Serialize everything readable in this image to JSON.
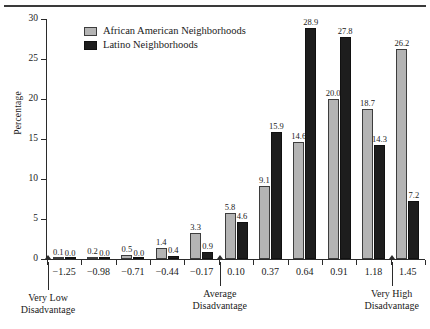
{
  "chart_data": {
    "type": "bar",
    "title": "",
    "xlabel": "",
    "ylabel": "Percentage",
    "ylim": [
      0,
      30
    ],
    "yticks": [
      0,
      5,
      10,
      15,
      20,
      25,
      30
    ],
    "grid": false,
    "legend_position": "top-left-inside",
    "categories": [
      "-1.25",
      "-0.98",
      "-0.71",
      "-0.44",
      "-0.17",
      "0.10",
      "0.37",
      "0.64",
      "0.91",
      "1.18",
      "1.45"
    ],
    "series": [
      {
        "name": "African American Neighborhoods",
        "color": "#b4b4b4",
        "values": [
          0.1,
          0.2,
          0.5,
          1.4,
          3.3,
          5.8,
          9.1,
          14.6,
          20.0,
          18.7,
          26.2
        ],
        "labels": [
          "0.1",
          "0.2",
          "0.5",
          "1.4",
          "3.3",
          "5.8",
          "9.1",
          "14.6",
          "20.0",
          "18.7",
          "26.2"
        ]
      },
      {
        "name": "Latino Neighborhoods",
        "color": "#1d1d1d",
        "values": [
          0.0,
          0.0,
          0.0,
          0.4,
          0.9,
          4.6,
          15.9,
          28.9,
          27.8,
          14.3,
          7.2
        ],
        "labels": [
          "0.0",
          "0.0",
          "0.0",
          "0.4",
          "0.9",
          "4.6",
          "15.9",
          "28.9",
          "27.8",
          "14.3",
          "7.2"
        ]
      }
    ],
    "annotations": [
      {
        "text_line1": "Very Low",
        "text_line2": "Disadvantage",
        "at_category": "-1.25"
      },
      {
        "text_line1": "Average",
        "text_line2": "Disadvantage",
        "at_category": "0.10"
      },
      {
        "text_line1": "Very High",
        "text_line2": "Disadvantage",
        "at_category": "1.45"
      }
    ]
  }
}
